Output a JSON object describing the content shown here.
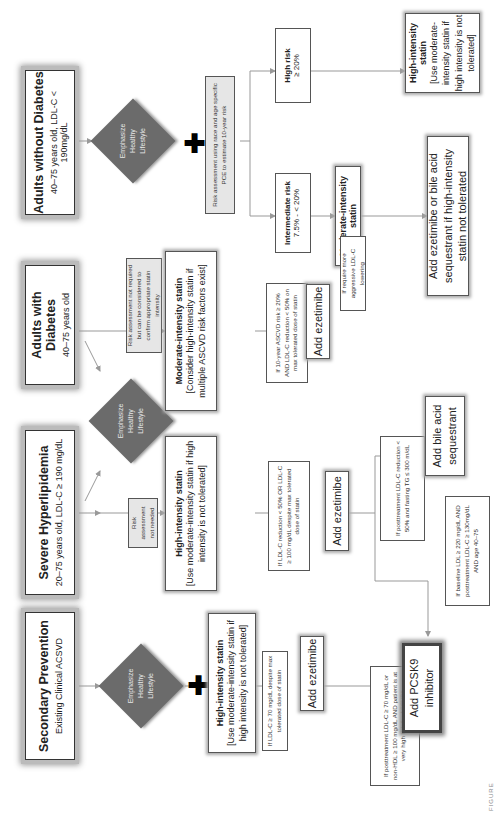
{
  "headers": [
    {
      "title": "Secondary Prevention",
      "subtitle": "Existing Clinical ACSVD"
    },
    {
      "title": "Severe Hyperlipidemia",
      "subtitle": "20–75 years old, LDL-C ≥ 190 mg/dL"
    },
    {
      "title": "Adults with Diabetes",
      "subtitle": "40–75 years old"
    },
    {
      "title": "Adults without Diabetes",
      "subtitle": "40–75 years old, LDL-C < 190mg/dL"
    }
  ],
  "lifestyle": {
    "line1": "Emphasize",
    "line2": "Healthy",
    "line3": "Lifestyle"
  },
  "risk": {
    "not_needed": "Risk assessment not needed",
    "not_required": "Risk assessment not required but can be considered to confirm appropriate statin intensity",
    "pce": "Risk assessment using race and age specific PCE to estimate 10-year risk",
    "high_title": "High risk",
    "high_value": "≥ 20%",
    "intermediate_title": "Intermediate risk",
    "intermediate_value": "7.5% - < 20%"
  },
  "statins": {
    "secondary": {
      "title": "High-intensity statin",
      "note": "[Use moderate-intensity statin if high intensity is not tolerated]"
    },
    "severe": {
      "title": "High-intensity statin",
      "note": "[Use moderate-intensity statin if high intensity is not tolerated]"
    },
    "diabetes": {
      "title": "Moderate-intensity statin",
      "note": "[Consider high-intensity statin if multiple ASCVD risk factors exist]"
    },
    "high_risk": {
      "title": "High-intensity statin",
      "note": "[Use moderate-intensity statin if high intensity is not tolerated]"
    },
    "intermediate": {
      "title": "Moderate-intensity statin"
    }
  },
  "conditions": {
    "secondary_ldl": "If LDL-C ≥ 70 mg/dL despite max tolerated dose of statin",
    "secondary_post": "If posttreatment LDL-C ≥ 70 mg/dL or non-HDL ≥ 100 mg/dL AND patient is at very high risk for ASCVD*",
    "severe_ldl": "If LDL-C reduction < 50% OR LDL-C ≥ 100 mg/dL despite max tolerated dose of statin",
    "severe_post": "If posttreatment LDL-C reduction < 50% and fasting TG ≤ 300 m/dL",
    "severe_baseline": "If baseline LDL ≥ 220 mg/dL AND posttreatment LDL-C ≥ 130mg/dL AND age 40–75",
    "diabetes": "If 10-year ASCVD risk ≥ 20% AND LDL-C reduction < 50% on max tolerated dose of statin",
    "aggressive": "If require more aggressive LDL-C lowering"
  },
  "actions": {
    "add_ezetimibe": "Add ezetimibe",
    "add_pcsk9": "Add PCSK9 inhibitor",
    "add_bile_acid": "Add bile acid sequestrant",
    "add_ezetimibe_or_bile": "Add ezetimibe or bile acid sequestrant if high-intensity statin not tolerated"
  },
  "caption": "FIGURE"
}
